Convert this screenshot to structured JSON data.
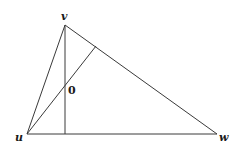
{
  "diagram": {
    "type": "triangle-with-altitudes",
    "vertices": {
      "v": {
        "label": "v",
        "x": 65,
        "y": 25
      },
      "u": {
        "label": "u",
        "x": 27,
        "y": 134
      },
      "w": {
        "label": "w",
        "x": 217,
        "y": 134
      }
    },
    "altitude_foot_v": {
      "x": 65,
      "y": 134
    },
    "altitude_foot_u": {
      "x": 96,
      "y": 46
    },
    "intersection_label": "0",
    "colors": {
      "stroke": "#3a3a3a",
      "text": "#1a1a1a",
      "background": "#ffffff"
    }
  }
}
